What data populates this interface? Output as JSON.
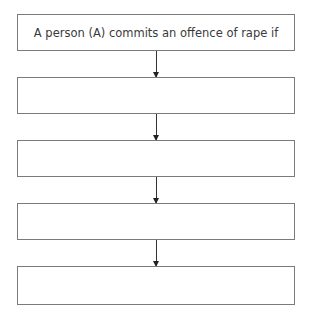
{
  "flowchart": {
    "boxes": [
      {
        "label": "A person (A) commits an offence of rape if"
      },
      {
        "label": ""
      },
      {
        "label": ""
      },
      {
        "label": ""
      },
      {
        "label": ""
      }
    ]
  }
}
